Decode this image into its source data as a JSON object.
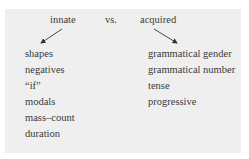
{
  "header": {
    "left": "innate",
    "middle": "vs.",
    "right": "acquired"
  },
  "innate_items": [
    "shapes",
    "negatives",
    "“if”",
    "modals",
    "mass–count",
    "duration"
  ],
  "acquired_items": [
    "grammatical gender",
    "grammatical number",
    "tense",
    "progressive"
  ],
  "colors": {
    "panel": "#efefef",
    "text": "#3a3a3a"
  }
}
